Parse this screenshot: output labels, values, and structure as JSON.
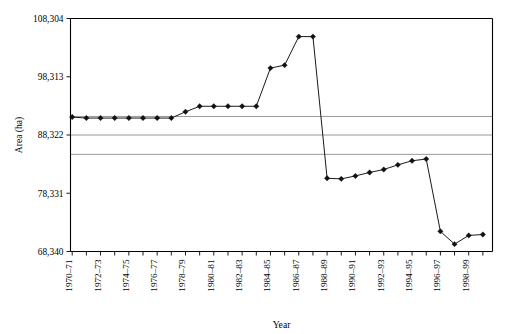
{
  "chart_data": {
    "type": "line",
    "title": "",
    "xlabel": "Year",
    "ylabel": "Area (ha)",
    "ylim": [
      68340,
      108304
    ],
    "ytick_labels": [
      "108,304",
      "98,313",
      "88,322",
      "78,331",
      "68,340"
    ],
    "ytick_values": [
      108304,
      98313,
      88322,
      78331,
      68340
    ],
    "grid": true,
    "gridlines_y": [
      91500,
      88322,
      85000
    ],
    "legend": "none",
    "x": [
      "1970-71",
      "1971-72",
      "1972-73",
      "1973-74",
      "1974-75",
      "1975-76",
      "1976-77",
      "1977-78",
      "1978-79",
      "1979-80",
      "1980-81",
      "1981-82",
      "1982-83",
      "1983-84",
      "1984-85",
      "1985-86",
      "1986-87",
      "1987-88",
      "1988-89",
      "1989-90",
      "1990-91",
      "1991-92",
      "1992-93",
      "1993-94",
      "1994-95",
      "1995-96",
      "1996-97",
      "1997-98",
      "1998-99",
      "1999-00"
    ],
    "xtick_labels": [
      "1970–71",
      "1972–73",
      "1974–75",
      "1976–77",
      "1978–79",
      "1980–81",
      "1982–83",
      "1984–85",
      "1986–87",
      "1988–89",
      "1990–91",
      "1992–93",
      "1994–95",
      "1996–97",
      "1998–99"
    ],
    "xtick_label_indices": [
      0,
      2,
      4,
      6,
      8,
      10,
      12,
      14,
      16,
      18,
      20,
      22,
      24,
      26,
      28
    ],
    "values": [
      91400,
      91230,
      91230,
      91230,
      91230,
      91230,
      91230,
      91230,
      92300,
      93250,
      93250,
      93250,
      93250,
      93250,
      99800,
      100300,
      105200,
      105200,
      80900,
      80800,
      81300,
      81900,
      82400,
      83200,
      83900,
      84200,
      71800,
      69600,
      71100,
      71250
    ],
    "series_name": "Area",
    "line_color": "#1a1a1a",
    "marker_color": "#111111",
    "grid_color": "#8d8d8d",
    "axis_color": "#000000"
  }
}
